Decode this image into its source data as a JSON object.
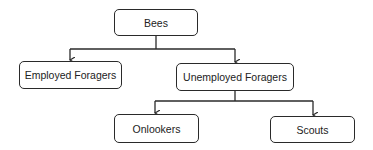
{
  "diagram": {
    "type": "tree",
    "nodes": {
      "root": {
        "label": "Bees"
      },
      "employed": {
        "label": "Employed Foragers"
      },
      "unemployed": {
        "label": "Unemployed Foragers"
      },
      "onlookers": {
        "label": "Onlookers"
      },
      "scouts": {
        "label": "Scouts"
      }
    },
    "edges": [
      {
        "from": "Bees",
        "to": "Employed Foragers"
      },
      {
        "from": "Bees",
        "to": "Unemployed Foragers"
      },
      {
        "from": "Unemployed Foragers",
        "to": "Onlookers"
      },
      {
        "from": "Unemployed Foragers",
        "to": "Scouts"
      }
    ],
    "colors": {
      "stroke": "#2a2a2a",
      "background": "#ffffff",
      "text": "#222222"
    }
  }
}
